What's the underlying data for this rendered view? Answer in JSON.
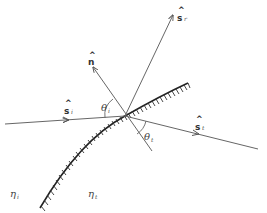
{
  "diagram": {
    "type": "refraction-at-curved-interface",
    "labels": {
      "normal": {
        "symbol": "n",
        "hat": "^"
      },
      "incident": {
        "symbol": "s",
        "sub": "i",
        "hat": "^"
      },
      "reflected": {
        "symbol": "s",
        "sub": "r",
        "hat": "^"
      },
      "transmitted": {
        "symbol": "s",
        "sub": "t",
        "hat": "^"
      },
      "theta_i": {
        "symbol": "θ",
        "sub": "i"
      },
      "theta_t": {
        "symbol": "θ",
        "sub": "t"
      },
      "eta_i": {
        "symbol": "η",
        "sub": "i"
      },
      "eta_t": {
        "symbol": "η",
        "sub": "t"
      }
    },
    "colors": {
      "line": "#666666",
      "hatch": "#333333",
      "background": "#ffffff"
    }
  }
}
